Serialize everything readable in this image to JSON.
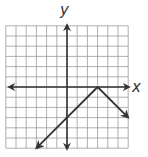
{
  "graph": {
    "xlabel": "x",
    "ylabel": "y",
    "grid": {
      "xmin": -6,
      "xmax": 6,
      "ymin": -6,
      "ymax": 6,
      "step": 1
    },
    "function": "y = -|x - 3|",
    "vertex": [
      3,
      0
    ],
    "colors": {
      "grid": "#9a9a9a",
      "axis": "#333333",
      "line": "#333333"
    }
  },
  "chart_data": {
    "type": "line",
    "title": "",
    "xlabel": "x",
    "ylabel": "y",
    "xlim": [
      -6,
      6
    ],
    "ylim": [
      -6,
      6
    ],
    "grid": true,
    "series": [
      {
        "name": "y = -|x - 3|",
        "x": [
          -3,
          3,
          6
        ],
        "y": [
          -6,
          0,
          -3
        ],
        "arrows": "both-ends"
      }
    ]
  }
}
